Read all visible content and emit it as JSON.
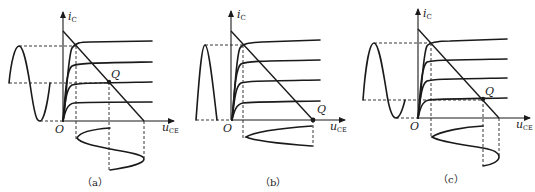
{
  "figure": {
    "panels": [
      {
        "id": "a",
        "caption": "（a）",
        "y_axis_label": "i",
        "y_axis_subscript": "C",
        "x_axis_label": "u",
        "x_axis_subscript": "CE",
        "origin_label": "O",
        "q_point_label": "Q",
        "description": "Q point centered on load line; full sine input produces full undistorted output"
      },
      {
        "id": "b",
        "caption": "（b）",
        "y_axis_label": "i",
        "y_axis_subscript": "C",
        "x_axis_label": "u",
        "x_axis_subscript": "CE",
        "origin_label": "O",
        "q_point_label": "Q",
        "description": "Q point at cutoff (class B); only half-wave conducts"
      },
      {
        "id": "c",
        "caption": "（c）",
        "y_axis_label": "i",
        "y_axis_subscript": "C",
        "x_axis_label": "u",
        "x_axis_subscript": "CE",
        "origin_label": "O",
        "q_point_label": "Q",
        "description": "Q point low on load line (class AB); output partially clipped"
      }
    ],
    "colors": {
      "line": "#1a1a1a",
      "background": "#ffffff"
    }
  }
}
